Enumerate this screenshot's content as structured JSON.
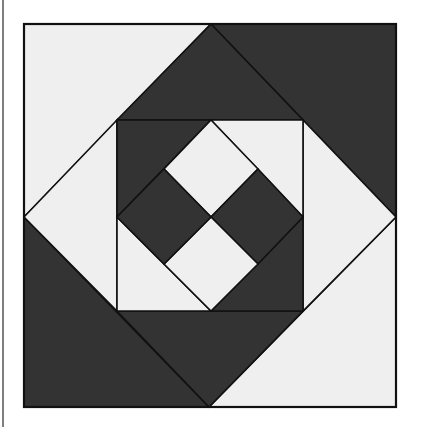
{
  "diagram": {
    "colors": {
      "dark": "#333333",
      "light": "#efefef",
      "stroke": "#111111",
      "background": "#ffffff"
    },
    "left_border_line": {
      "x": 3,
      "y1": 0,
      "y2": 427
    },
    "outer_square": {
      "x1": 24,
      "y1": 24,
      "x2": 396,
      "y2": 407
    },
    "outer_diamond": {
      "top": [
        211,
        24
      ],
      "right": [
        396,
        217
      ],
      "bottom": [
        209,
        407
      ],
      "left": [
        24,
        217
      ]
    },
    "inner_square": {
      "x1": 117,
      "y1": 120,
      "x2": 303,
      "y2": 311
    },
    "inner_diamond": {
      "top": [
        211,
        120
      ],
      "right": [
        303,
        217
      ],
      "bottom": [
        211,
        311
      ],
      "left": [
        117,
        217
      ]
    },
    "center": [
      211,
      217
    ],
    "pieces": [
      {
        "name": "corner-top-left",
        "fill": "light",
        "points": "24,24 211,24 24,217"
      },
      {
        "name": "corner-top-right",
        "fill": "dark",
        "points": "211,24 396,24 396,217"
      },
      {
        "name": "corner-bottom-right",
        "fill": "light",
        "points": "396,217 396,407 209,407"
      },
      {
        "name": "corner-bottom-left",
        "fill": "dark",
        "points": "24,217 209,407 24,407"
      },
      {
        "name": "ring-top",
        "fill": "dark",
        "points": "211,24 303,120 117,120"
      },
      {
        "name": "ring-right",
        "fill": "light",
        "points": "303,120 396,217 303,311"
      },
      {
        "name": "ring-bottom",
        "fill": "dark",
        "points": "117,311 303,311 209,407"
      },
      {
        "name": "ring-left",
        "fill": "light",
        "points": "24,217 117,120 117,311"
      },
      {
        "name": "inner-corner-top-left",
        "fill": "dark",
        "points": "117,120 211,120 117,217"
      },
      {
        "name": "inner-corner-top-right",
        "fill": "light",
        "points": "211,120 303,120 303,217"
      },
      {
        "name": "inner-corner-bottom-right",
        "fill": "dark",
        "points": "303,217 303,311 211,311"
      },
      {
        "name": "inner-corner-bottom-left",
        "fill": "light",
        "points": "117,217 211,311 117,311"
      },
      {
        "name": "center-top",
        "fill": "light",
        "points": "211,120 258,169 211,217 164,169"
      },
      {
        "name": "center-right",
        "fill": "dark",
        "points": "258,169 303,217 258,264 211,217"
      },
      {
        "name": "center-bottom",
        "fill": "light",
        "points": "211,217 258,264 211,311 164,264"
      },
      {
        "name": "center-left",
        "fill": "dark",
        "points": "164,169 211,217 164,264 117,217"
      },
      {
        "name": "center-top-left-edge",
        "fill": "dark",
        "points": "117,217 164,169 211,120 117,120"
      }
    ]
  }
}
